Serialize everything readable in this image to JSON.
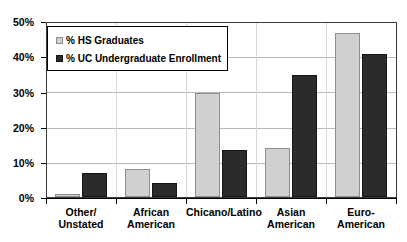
{
  "chart_data": {
    "type": "bar",
    "title": "",
    "subtitle": "",
    "xlabel": "",
    "ylabel": "",
    "categories": [
      "Other/ Unstated",
      "African American",
      "Chicano/Latino",
      "Asian American",
      "Euro-American"
    ],
    "category_lines": [
      [
        "Other/",
        "Unstated"
      ],
      [
        "African",
        "American"
      ],
      [
        "Chicano/Latino",
        ""
      ],
      [
        "Asian",
        "American"
      ],
      [
        "Euro-American",
        ""
      ]
    ],
    "series": [
      {
        "name": "% HS Graduates",
        "color": "#d0d0d0",
        "values": [
          1,
          8,
          30,
          14,
          47
        ]
      },
      {
        "name": "% UC Undergraduate Enrollment",
        "color": "#2b2b2b",
        "values": [
          7,
          4,
          13.5,
          35,
          41
        ]
      }
    ],
    "ylim": [
      0,
      50
    ],
    "yticks": [
      0,
      10,
      20,
      30,
      40,
      50
    ],
    "ytick_labels": [
      "0%",
      "10%",
      "20%",
      "30%",
      "40%",
      "50%"
    ],
    "grid": true,
    "grid_axis": "y",
    "legend_position": "upper-left-inside",
    "value_suffix": "%"
  },
  "legend": {
    "entries": [
      {
        "label": "% HS Graduates",
        "swatch": "light-gray-square-icon"
      },
      {
        "label": "% UC Undergraduate Enrollment",
        "swatch": "dark-square-icon"
      }
    ]
  }
}
